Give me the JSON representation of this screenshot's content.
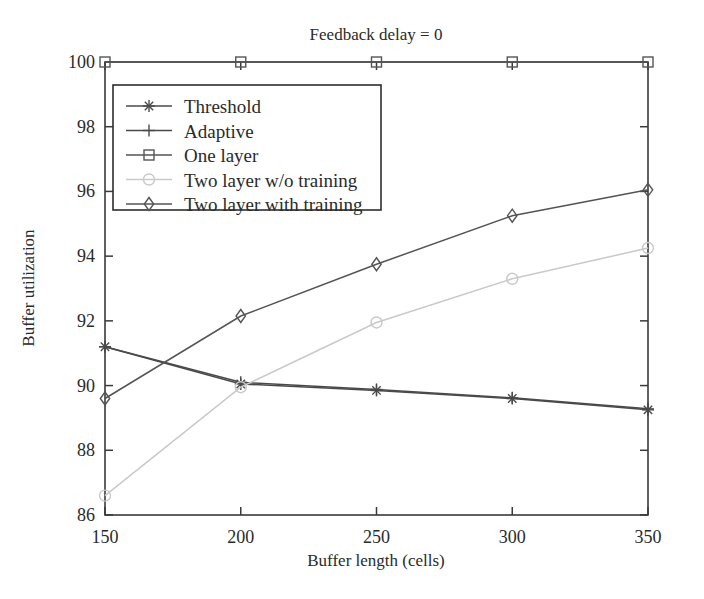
{
  "figure": {
    "title": "Feedback delay = 0",
    "background": "#ffffff"
  },
  "axes": {
    "x_label": "Buffer length (cells)",
    "y_label": "Buffer utilization",
    "x_ticks": [
      "150",
      "200",
      "250",
      "300",
      "350"
    ],
    "y_ticks": [
      "86",
      "88",
      "90",
      "92",
      "94",
      "96",
      "98",
      "100"
    ],
    "frame_color": "#3a3a3a"
  },
  "legend": {
    "entries": [
      {
        "label": "Threshold",
        "marker": "star-marker",
        "color": "#4a4a4a"
      },
      {
        "label": "Adaptive",
        "marker": "plus-marker",
        "color": "#4a4a4a"
      },
      {
        "label": "One layer",
        "marker": "square-marker",
        "color": "#555555"
      },
      {
        "label": "Two layer w/o training",
        "marker": "circle-marker",
        "color": "#c9c9c9"
      },
      {
        "label": "Two layer with training",
        "marker": "diamond-marker",
        "color": "#545454"
      }
    ]
  },
  "chart_data": {
    "type": "line",
    "title": "Feedback delay = 0",
    "xlabel": "Buffer length (cells)",
    "ylabel": "Buffer utilization",
    "x": [
      150,
      200,
      250,
      300,
      350
    ],
    "xlim": [
      150,
      350
    ],
    "ylim": [
      86,
      100
    ],
    "xticks": [
      150,
      200,
      250,
      300,
      350
    ],
    "yticks": [
      86,
      88,
      90,
      92,
      94,
      96,
      98,
      100
    ],
    "grid": false,
    "legend_position": "upper-left-inside",
    "series": [
      {
        "name": "Threshold",
        "marker": "star",
        "color": "#4a4a4a",
        "values": [
          91.2,
          90.05,
          89.85,
          89.6,
          89.25
        ]
      },
      {
        "name": "Adaptive",
        "marker": "plus",
        "color": "#4a4a4a",
        "values": [
          91.2,
          90.1,
          89.88,
          89.62,
          89.28
        ]
      },
      {
        "name": "One layer",
        "marker": "square",
        "color": "#555555",
        "values": [
          100,
          100,
          100,
          100,
          100
        ]
      },
      {
        "name": "Two layer w/o training",
        "marker": "circle",
        "color": "#c9c9c9",
        "values": [
          86.6,
          89.95,
          91.95,
          93.3,
          94.25
        ]
      },
      {
        "name": "Two layer with training",
        "marker": "diamond",
        "color": "#545454",
        "values": [
          89.6,
          92.15,
          93.75,
          95.25,
          96.05
        ]
      }
    ]
  }
}
